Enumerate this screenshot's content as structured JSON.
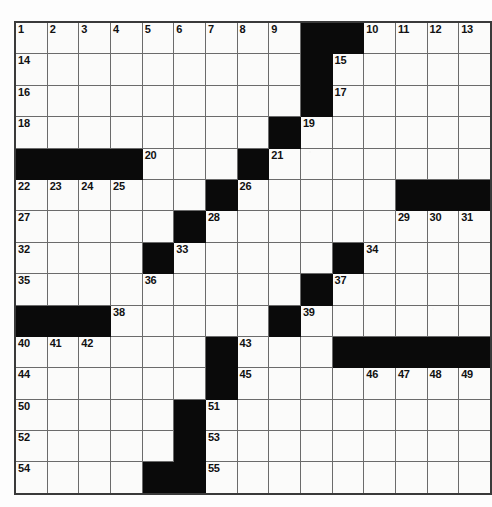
{
  "page": {
    "top_partial_text": "",
    "background_color": "#fdfdfd"
  },
  "crossword": {
    "title": "Crossword Puzzle Grid",
    "rows": 15,
    "cols": 15,
    "fill_color": "#0a0a0a",
    "cell_color": "#fbfbfa",
    "border_color": "#6b6b6b",
    "outer_border_color": "#3a3a3a",
    "number_color": "#111111",
    "max_clue_number": 55,
    "grid": [
      [
        {
          "black": false,
          "num": "1"
        },
        {
          "black": false,
          "num": "2"
        },
        {
          "black": false,
          "num": "3"
        },
        {
          "black": false,
          "num": "4"
        },
        {
          "black": false,
          "num": "5"
        },
        {
          "black": false,
          "num": "6"
        },
        {
          "black": false,
          "num": "7"
        },
        {
          "black": false,
          "num": "8"
        },
        {
          "black": false,
          "num": "9"
        },
        {
          "black": true,
          "num": ""
        },
        {
          "black": true,
          "num": ""
        },
        {
          "black": false,
          "num": "10"
        },
        {
          "black": false,
          "num": "11"
        },
        {
          "black": false,
          "num": "12"
        },
        {
          "black": false,
          "num": "13"
        }
      ],
      [
        {
          "black": false,
          "num": "14"
        },
        {
          "black": false,
          "num": ""
        },
        {
          "black": false,
          "num": ""
        },
        {
          "black": false,
          "num": ""
        },
        {
          "black": false,
          "num": ""
        },
        {
          "black": false,
          "num": ""
        },
        {
          "black": false,
          "num": ""
        },
        {
          "black": false,
          "num": ""
        },
        {
          "black": false,
          "num": ""
        },
        {
          "black": true,
          "num": ""
        },
        {
          "black": false,
          "num": "15"
        },
        {
          "black": false,
          "num": ""
        },
        {
          "black": false,
          "num": ""
        },
        {
          "black": false,
          "num": ""
        },
        {
          "black": false,
          "num": ""
        }
      ],
      [
        {
          "black": false,
          "num": "16"
        },
        {
          "black": false,
          "num": ""
        },
        {
          "black": false,
          "num": ""
        },
        {
          "black": false,
          "num": ""
        },
        {
          "black": false,
          "num": ""
        },
        {
          "black": false,
          "num": ""
        },
        {
          "black": false,
          "num": ""
        },
        {
          "black": false,
          "num": ""
        },
        {
          "black": false,
          "num": ""
        },
        {
          "black": true,
          "num": ""
        },
        {
          "black": false,
          "num": "17"
        },
        {
          "black": false,
          "num": ""
        },
        {
          "black": false,
          "num": ""
        },
        {
          "black": false,
          "num": ""
        },
        {
          "black": false,
          "num": ""
        }
      ],
      [
        {
          "black": false,
          "num": "18"
        },
        {
          "black": false,
          "num": ""
        },
        {
          "black": false,
          "num": ""
        },
        {
          "black": false,
          "num": ""
        },
        {
          "black": false,
          "num": ""
        },
        {
          "black": false,
          "num": ""
        },
        {
          "black": false,
          "num": ""
        },
        {
          "black": false,
          "num": ""
        },
        {
          "black": true,
          "num": ""
        },
        {
          "black": false,
          "num": "19"
        },
        {
          "black": false,
          "num": ""
        },
        {
          "black": false,
          "num": ""
        },
        {
          "black": false,
          "num": ""
        },
        {
          "black": false,
          "num": ""
        },
        {
          "black": false,
          "num": ""
        }
      ],
      [
        {
          "black": true,
          "num": ""
        },
        {
          "black": true,
          "num": ""
        },
        {
          "black": true,
          "num": ""
        },
        {
          "black": true,
          "num": ""
        },
        {
          "black": false,
          "num": "20"
        },
        {
          "black": false,
          "num": ""
        },
        {
          "black": false,
          "num": ""
        },
        {
          "black": true,
          "num": ""
        },
        {
          "black": false,
          "num": "21"
        },
        {
          "black": false,
          "num": ""
        },
        {
          "black": false,
          "num": ""
        },
        {
          "black": false,
          "num": ""
        },
        {
          "black": false,
          "num": ""
        },
        {
          "black": false,
          "num": ""
        },
        {
          "black": false,
          "num": ""
        }
      ],
      [
        {
          "black": false,
          "num": "22"
        },
        {
          "black": false,
          "num": "23"
        },
        {
          "black": false,
          "num": "24"
        },
        {
          "black": false,
          "num": "25"
        },
        {
          "black": false,
          "num": ""
        },
        {
          "black": false,
          "num": ""
        },
        {
          "black": true,
          "num": ""
        },
        {
          "black": false,
          "num": "26"
        },
        {
          "black": false,
          "num": ""
        },
        {
          "black": false,
          "num": ""
        },
        {
          "black": false,
          "num": ""
        },
        {
          "black": false,
          "num": ""
        },
        {
          "black": true,
          "num": ""
        },
        {
          "black": true,
          "num": ""
        },
        {
          "black": true,
          "num": ""
        }
      ],
      [
        {
          "black": false,
          "num": "27"
        },
        {
          "black": false,
          "num": ""
        },
        {
          "black": false,
          "num": ""
        },
        {
          "black": false,
          "num": ""
        },
        {
          "black": false,
          "num": ""
        },
        {
          "black": true,
          "num": ""
        },
        {
          "black": false,
          "num": "28"
        },
        {
          "black": false,
          "num": ""
        },
        {
          "black": false,
          "num": ""
        },
        {
          "black": false,
          "num": ""
        },
        {
          "black": false,
          "num": ""
        },
        {
          "black": false,
          "num": ""
        },
        {
          "black": false,
          "num": "29"
        },
        {
          "black": false,
          "num": "30"
        },
        {
          "black": false,
          "num": "31"
        }
      ],
      [
        {
          "black": false,
          "num": "32"
        },
        {
          "black": false,
          "num": ""
        },
        {
          "black": false,
          "num": ""
        },
        {
          "black": false,
          "num": ""
        },
        {
          "black": true,
          "num": ""
        },
        {
          "black": false,
          "num": "33"
        },
        {
          "black": false,
          "num": ""
        },
        {
          "black": false,
          "num": ""
        },
        {
          "black": false,
          "num": ""
        },
        {
          "black": false,
          "num": ""
        },
        {
          "black": true,
          "num": ""
        },
        {
          "black": false,
          "num": "34"
        },
        {
          "black": false,
          "num": ""
        },
        {
          "black": false,
          "num": ""
        },
        {
          "black": false,
          "num": ""
        }
      ],
      [
        {
          "black": false,
          "num": "35"
        },
        {
          "black": false,
          "num": ""
        },
        {
          "black": false,
          "num": ""
        },
        {
          "black": false,
          "num": ""
        },
        {
          "black": false,
          "num": "36"
        },
        {
          "black": false,
          "num": ""
        },
        {
          "black": false,
          "num": ""
        },
        {
          "black": false,
          "num": ""
        },
        {
          "black": false,
          "num": ""
        },
        {
          "black": true,
          "num": ""
        },
        {
          "black": false,
          "num": "37"
        },
        {
          "black": false,
          "num": ""
        },
        {
          "black": false,
          "num": ""
        },
        {
          "black": false,
          "num": ""
        },
        {
          "black": false,
          "num": ""
        }
      ],
      [
        {
          "black": true,
          "num": ""
        },
        {
          "black": true,
          "num": ""
        },
        {
          "black": true,
          "num": ""
        },
        {
          "black": false,
          "num": "38"
        },
        {
          "black": false,
          "num": ""
        },
        {
          "black": false,
          "num": ""
        },
        {
          "black": false,
          "num": ""
        },
        {
          "black": false,
          "num": ""
        },
        {
          "black": true,
          "num": ""
        },
        {
          "black": false,
          "num": "39"
        },
        {
          "black": false,
          "num": ""
        },
        {
          "black": false,
          "num": ""
        },
        {
          "black": false,
          "num": ""
        },
        {
          "black": false,
          "num": ""
        },
        {
          "black": false,
          "num": ""
        }
      ],
      [
        {
          "black": false,
          "num": "40"
        },
        {
          "black": false,
          "num": "41"
        },
        {
          "black": false,
          "num": "42"
        },
        {
          "black": false,
          "num": ""
        },
        {
          "black": false,
          "num": ""
        },
        {
          "black": false,
          "num": ""
        },
        {
          "black": true,
          "num": ""
        },
        {
          "black": false,
          "num": "43"
        },
        {
          "black": false,
          "num": ""
        },
        {
          "black": false,
          "num": ""
        },
        {
          "black": true,
          "num": ""
        },
        {
          "black": true,
          "num": ""
        },
        {
          "black": true,
          "num": ""
        },
        {
          "black": true,
          "num": ""
        },
        {
          "black": true,
          "num": ""
        }
      ],
      [
        {
          "black": false,
          "num": "44"
        },
        {
          "black": false,
          "num": ""
        },
        {
          "black": false,
          "num": ""
        },
        {
          "black": false,
          "num": ""
        },
        {
          "black": false,
          "num": ""
        },
        {
          "black": false,
          "num": ""
        },
        {
          "black": true,
          "num": ""
        },
        {
          "black": false,
          "num": "45"
        },
        {
          "black": false,
          "num": ""
        },
        {
          "black": false,
          "num": ""
        },
        {
          "black": false,
          "num": ""
        },
        {
          "black": false,
          "num": "46"
        },
        {
          "black": false,
          "num": "47"
        },
        {
          "black": false,
          "num": "48"
        },
        {
          "black": false,
          "num": "49"
        }
      ],
      [
        {
          "black": false,
          "num": "50"
        },
        {
          "black": false,
          "num": ""
        },
        {
          "black": false,
          "num": ""
        },
        {
          "black": false,
          "num": ""
        },
        {
          "black": false,
          "num": ""
        },
        {
          "black": true,
          "num": ""
        },
        {
          "black": false,
          "num": "51"
        },
        {
          "black": false,
          "num": ""
        },
        {
          "black": false,
          "num": ""
        },
        {
          "black": false,
          "num": ""
        },
        {
          "black": false,
          "num": ""
        },
        {
          "black": false,
          "num": ""
        },
        {
          "black": false,
          "num": ""
        },
        {
          "black": false,
          "num": ""
        },
        {
          "black": false,
          "num": ""
        }
      ],
      [
        {
          "black": false,
          "num": "52"
        },
        {
          "black": false,
          "num": ""
        },
        {
          "black": false,
          "num": ""
        },
        {
          "black": false,
          "num": ""
        },
        {
          "black": false,
          "num": ""
        },
        {
          "black": true,
          "num": ""
        },
        {
          "black": false,
          "num": "53"
        },
        {
          "black": false,
          "num": ""
        },
        {
          "black": false,
          "num": ""
        },
        {
          "black": false,
          "num": ""
        },
        {
          "black": false,
          "num": ""
        },
        {
          "black": false,
          "num": ""
        },
        {
          "black": false,
          "num": ""
        },
        {
          "black": false,
          "num": ""
        },
        {
          "black": false,
          "num": ""
        }
      ],
      [
        {
          "black": false,
          "num": "54"
        },
        {
          "black": false,
          "num": ""
        },
        {
          "black": false,
          "num": ""
        },
        {
          "black": false,
          "num": ""
        },
        {
          "black": true,
          "num": ""
        },
        {
          "black": true,
          "num": ""
        },
        {
          "black": false,
          "num": "55"
        },
        {
          "black": false,
          "num": ""
        },
        {
          "black": false,
          "num": ""
        },
        {
          "black": false,
          "num": ""
        },
        {
          "black": false,
          "num": ""
        },
        {
          "black": false,
          "num": ""
        },
        {
          "black": false,
          "num": ""
        },
        {
          "black": false,
          "num": ""
        },
        {
          "black": false,
          "num": ""
        }
      ]
    ]
  }
}
